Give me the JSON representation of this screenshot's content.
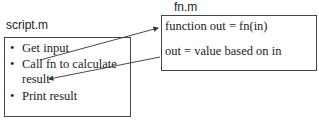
{
  "script_box": {
    "title": "script.m",
    "bullets": [
      "Get input",
      "Call fn to calculate",
      "result",
      "Print result"
    ],
    "bullet_symbol": "•"
  },
  "fn_box": {
    "title": "fn.m",
    "line1": "function out = fn(in)",
    "line2": "out = value based on in"
  },
  "arrows": [
    {
      "from": "script-call-line",
      "to": "fn-function-line",
      "direction": "right"
    },
    {
      "from": "fn-out-line",
      "to": "script-result-line",
      "direction": "left"
    }
  ]
}
